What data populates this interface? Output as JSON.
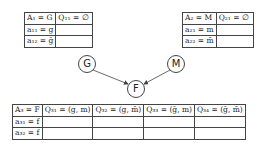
{
  "nodes": {
    "G": {
      "label": "G"
    },
    "M": {
      "label": "M"
    },
    "F": {
      "label": "F"
    }
  },
  "table1": {
    "header": [
      "A₁ = G",
      "Q₁₁ = ∅"
    ],
    "rows": [
      [
        "a₁₁ = g",
        ""
      ],
      [
        "a₁₂ = ḡ",
        ""
      ]
    ]
  },
  "table2": {
    "header": [
      "A₂ = M",
      "Q₂₁ = ∅"
    ],
    "rows": [
      [
        "a₂₁ = m",
        ""
      ],
      [
        "a₂₂ = m̄",
        ""
      ]
    ]
  },
  "table3": {
    "header": [
      "A₃ = F",
      "Q₃₁ = (g, m)",
      "Q₃₂ = (g, m̄)",
      "Q₃₃ = (ḡ, m)",
      "Q₃₄ = (ḡ, m̄)"
    ],
    "rows": [
      [
        "a₃₁ = f",
        "",
        "",
        "",
        ""
      ],
      [
        "a₃₂ = f̄",
        "",
        "",
        "",
        ""
      ]
    ]
  },
  "edges": [
    [
      "G",
      "F"
    ],
    [
      "M",
      "F"
    ]
  ]
}
